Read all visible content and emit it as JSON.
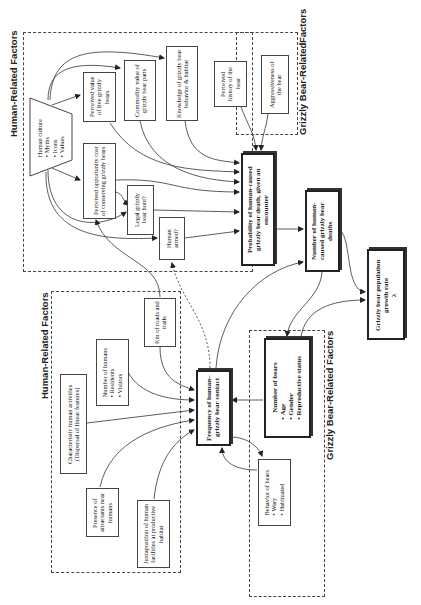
{
  "diagram": {
    "orientation": "rotated-90-ccw",
    "regions": {
      "top_human": {
        "label": "Human-Related Factors"
      },
      "top_bear": {
        "label": "Grizzly Bear-Related Factors",
        "line1": "Grizzly Bear-Related",
        "line2": "Factors"
      },
      "bottom_human": {
        "label": "Human-Related Factors"
      },
      "bottom_bear": {
        "label": "Grizzly Bear-Related Factors"
      }
    },
    "nodes": {
      "human_culture": {
        "title": "Human culture",
        "items": [
          "Myths",
          "Icons",
          "Values"
        ]
      },
      "perceived_value": {
        "text": "Perceived value of live grizzly bears"
      },
      "commodity_value": {
        "text": "Commodity value of grizzly bear parts"
      },
      "knowledge": {
        "text": "Knowledge of grizzly bear behavior & habitat"
      },
      "perceived_history": {
        "text": "Perceived history of the bear"
      },
      "aggressiveness": {
        "text": "Aggressiveness of the bear"
      },
      "opportunity_cost": {
        "text": "Perceived opportunity cost of conserving grizzly bears"
      },
      "legal_hunt": {
        "text": "Legal grizzly bear hunt?"
      },
      "human_armed": {
        "text": "Human armed?"
      },
      "probability_death": {
        "text": "Probability of human-caused grizzly bear death, given an encounter"
      },
      "number_deaths": {
        "text": "Number of human-caused grizzly bear deaths"
      },
      "growth_rate": {
        "text": "Grizzly bear population growth rate",
        "symbol": "λ"
      },
      "km_roads": {
        "text": "Km of roads and trails"
      },
      "number_humans": {
        "title": "Number of humans",
        "items": [
          "Residents",
          "Visitors"
        ]
      },
      "human_activities": {
        "text": "Characteristic human activities (Dispersal of linear features)"
      },
      "attractants": {
        "text": "Presence of attractants near humans"
      },
      "juxtaposition": {
        "text": "Juxtaposition of human facilities at productive habitat"
      },
      "frequency_contact": {
        "text": "Frequency of human–grizzly bear contact"
      },
      "number_bears": {
        "title": "Number of bears",
        "items": [
          "Age",
          "Gender",
          "Reproductive status"
        ]
      },
      "behavior_bears": {
        "title": "Behavior of bears",
        "items": [
          "Wary",
          "Habituated"
        ]
      }
    },
    "colors": {
      "line": "#333333",
      "background": "#ffffff"
    }
  }
}
